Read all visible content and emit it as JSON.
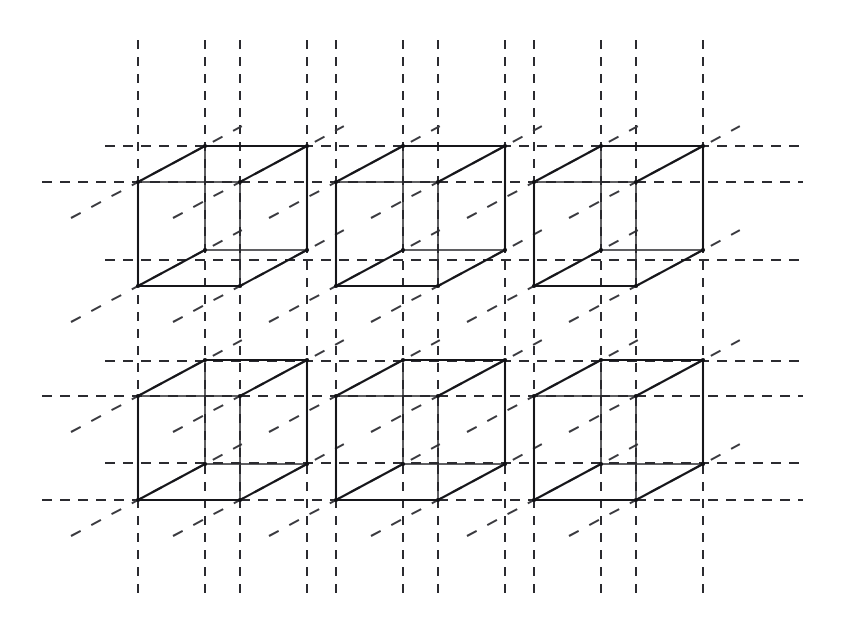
{
  "figure": {
    "background_color": "#ffffff",
    "solid_edge_color": "#16161a",
    "dashed_line_color": "#2b2b30",
    "canvas": {
      "width": 841,
      "height": 634
    }
  },
  "chart_data": {
    "type": "diagram",
    "projection": "oblique cabinet projection",
    "cube_columns": 3,
    "cube_rows": 2,
    "cube_count": 6,
    "front_face_width": 102,
    "front_face_height": 104,
    "depth_offset_x": 67,
    "depth_offset_y": -36,
    "column_spacing": 198,
    "row_spacing": 214,
    "front_origins_x": [
      138,
      336,
      534
    ],
    "front_origins_y": [
      286,
      500
    ],
    "vertices_per_cube": 8,
    "edges_per_cube": 12,
    "dashed_vertical_x": [
      138,
      205,
      240,
      307,
      336,
      403,
      438,
      505,
      534,
      601,
      636,
      703
    ],
    "dashed_horizontal_y": [
      146,
      182,
      260,
      361,
      396,
      463,
      500
    ],
    "dashed_vertical_extent": [
      40,
      600
    ],
    "dashed_horizontal_extent": [
      42,
      803
    ],
    "grid": "dashed lattice guide lines",
    "legend": "none"
  },
  "cubes": [
    {
      "id": "cube-r1-c1",
      "row": 1,
      "col": 1,
      "front_x": 138,
      "front_y": 286
    },
    {
      "id": "cube-r1-c2",
      "row": 1,
      "col": 2,
      "front_x": 336,
      "front_y": 286
    },
    {
      "id": "cube-r1-c3",
      "row": 1,
      "col": 3,
      "front_x": 534,
      "front_y": 286
    },
    {
      "id": "cube-r2-c1",
      "row": 2,
      "col": 1,
      "front_x": 138,
      "front_y": 500
    },
    {
      "id": "cube-r2-c2",
      "row": 2,
      "col": 2,
      "front_x": 336,
      "front_y": 500
    },
    {
      "id": "cube-r2-c3",
      "row": 2,
      "col": 3,
      "front_x": 534,
      "front_y": 500
    }
  ]
}
